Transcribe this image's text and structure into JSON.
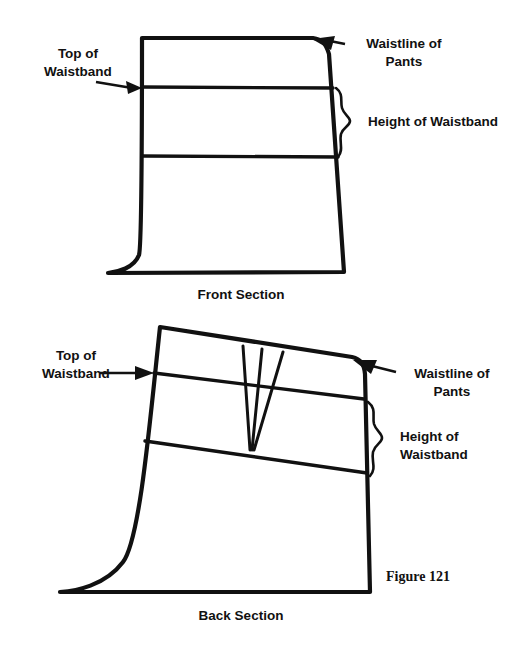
{
  "figure": {
    "number_label": "Figure 121",
    "background_color": "#ffffff",
    "ink_color": "#111111"
  },
  "front_panel": {
    "caption": "Front Section",
    "labels": {
      "top_of_waistband_line1": "Top of",
      "top_of_waistband_line2": "Waistband",
      "waistline_line1": "Waistline of",
      "waistline_line2": "Pants",
      "height_of_waistband": "Height of Waistband"
    },
    "annotations": {
      "waistline_marker": "arrow-to-top-right-corner",
      "top_of_waistband_marker": "arrow-to-left-edge",
      "height_marker": "curly-brace-right-side"
    }
  },
  "back_panel": {
    "caption": "Back Section",
    "labels": {
      "top_of_waistband_line1": "Top of",
      "top_of_waistband_line2": "Waistband",
      "waistline_line1": "Waistline of",
      "waistline_line2": "Pants",
      "height_of_waistband_line1": "Height of",
      "height_of_waistband_line2": "Waistband"
    },
    "annotations": {
      "waistline_marker": "arrow-to-top-right-corner",
      "top_of_waistband_marker": "arrow-to-left-edge",
      "height_marker": "curly-brace-right-side",
      "dart_marker": "three-line-converging-dart"
    }
  }
}
